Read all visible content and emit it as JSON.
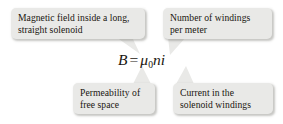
{
  "figure": {
    "type": "annotated-equation",
    "background_color": "#ffffff",
    "box_fill_color": "#e9e9e7",
    "text_color": "#19150f"
  },
  "equation": {
    "full_text": "B = μ₀ni",
    "left_symbol": "B",
    "equals": "=",
    "mu": "μ",
    "mu_subscript": "0",
    "n_symbol": "n",
    "i_symbol": "i"
  },
  "callouts": [
    {
      "id": "magnetic-field",
      "position": "top-left",
      "lines": [
        "Magnetic field inside a long,",
        "straight solenoid"
      ],
      "points_to": "B"
    },
    {
      "id": "windings-per-meter",
      "position": "top-right",
      "lines": [
        "Number of windings",
        "per meter"
      ],
      "points_to": "n"
    },
    {
      "id": "permeability",
      "position": "bottom-left",
      "lines": [
        "Permeability of",
        "free space"
      ],
      "points_to": "μ₀"
    },
    {
      "id": "current",
      "position": "bottom-right",
      "lines": [
        "Current in the",
        "solenoid windings"
      ],
      "points_to": "i"
    }
  ]
}
